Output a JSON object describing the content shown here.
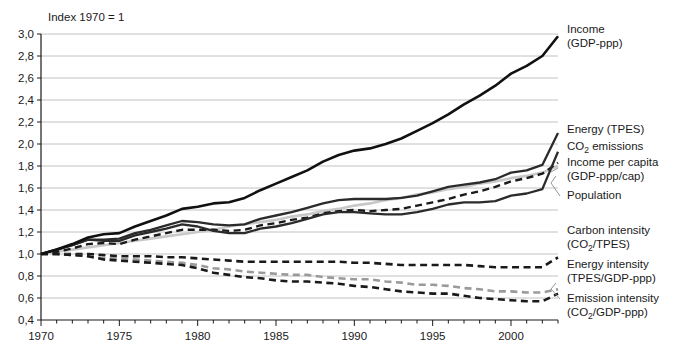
{
  "chart_data": {
    "type": "line",
    "title": "Index 1970 = 1",
    "xlabel": "",
    "ylabel": "",
    "xlim": [
      1970,
      2003
    ],
    "ylim": [
      0.4,
      3.0
    ],
    "ytick_step": 0.2,
    "grid": true,
    "legend_position": "right-inline-labels",
    "decimal_separator": ",",
    "xticks": [
      1970,
      1975,
      1980,
      1985,
      1990,
      1995,
      2000
    ],
    "xtick_labels": [
      "1970",
      "1975",
      "1980",
      "1985",
      "1990",
      "1995",
      "2000"
    ],
    "yticks": [
      0.4,
      0.6,
      0.8,
      1.0,
      1.2,
      1.4,
      1.6,
      1.8,
      2.0,
      2.2,
      2.4,
      2.6,
      2.8,
      3.0
    ],
    "ytick_labels": [
      "0,4",
      "0,6",
      "0,8",
      "1,0",
      "1,2",
      "1,4",
      "1,6",
      "1,8",
      "2,0",
      "2,2",
      "2,4",
      "2,6",
      "2,8",
      "3,0"
    ],
    "x": [
      1970,
      1971,
      1972,
      1973,
      1974,
      1975,
      1976,
      1977,
      1978,
      1979,
      1980,
      1981,
      1982,
      1983,
      1984,
      1985,
      1986,
      1987,
      1988,
      1989,
      1990,
      1991,
      1992,
      1993,
      1994,
      1995,
      1996,
      1997,
      1998,
      1999,
      2000,
      2001,
      2002,
      2003
    ],
    "series": [
      {
        "name": "Income (GDP-ppp)",
        "label_lines": [
          "Income",
          "(GDP-ppp)"
        ],
        "style": "solid",
        "color": "#111111",
        "width": 2.6,
        "values": [
          1.0,
          1.04,
          1.09,
          1.15,
          1.18,
          1.19,
          1.25,
          1.3,
          1.35,
          1.41,
          1.43,
          1.46,
          1.47,
          1.51,
          1.58,
          1.64,
          1.7,
          1.76,
          1.84,
          1.9,
          1.94,
          1.96,
          2.0,
          2.05,
          2.12,
          2.19,
          2.27,
          2.36,
          2.44,
          2.53,
          2.64,
          2.71,
          2.8,
          2.98
        ]
      },
      {
        "name": "Energy (TPES)",
        "label_lines": [
          "Energy (TPES)"
        ],
        "style": "solid",
        "color": "#2b2b2b",
        "width": 2.3,
        "values": [
          1.0,
          1.04,
          1.08,
          1.13,
          1.13,
          1.14,
          1.19,
          1.22,
          1.26,
          1.3,
          1.29,
          1.27,
          1.26,
          1.27,
          1.32,
          1.35,
          1.38,
          1.42,
          1.46,
          1.49,
          1.5,
          1.5,
          1.5,
          1.51,
          1.53,
          1.57,
          1.61,
          1.63,
          1.65,
          1.68,
          1.74,
          1.76,
          1.81,
          2.1
        ]
      },
      {
        "name": "CO2 emissions",
        "label_lines": [
          "CO",
          "2",
          " emissions"
        ],
        "style": "solid",
        "color": "#2b2b2b",
        "width": 2.3,
        "values": [
          1.0,
          1.04,
          1.08,
          1.13,
          1.12,
          1.12,
          1.17,
          1.2,
          1.23,
          1.27,
          1.25,
          1.21,
          1.19,
          1.19,
          1.23,
          1.25,
          1.28,
          1.32,
          1.36,
          1.38,
          1.38,
          1.37,
          1.36,
          1.36,
          1.38,
          1.41,
          1.45,
          1.47,
          1.47,
          1.48,
          1.53,
          1.55,
          1.59,
          1.93
        ]
      },
      {
        "name": "Income per capita (GDP-ppp/cap)",
        "label_lines": [
          "Income per capita",
          "(GDP-ppp/cap)"
        ],
        "style": "dashed",
        "color": "#1a1a1a",
        "width": 2.4,
        "values": [
          1.0,
          1.02,
          1.05,
          1.09,
          1.1,
          1.09,
          1.13,
          1.16,
          1.19,
          1.22,
          1.22,
          1.22,
          1.21,
          1.22,
          1.26,
          1.28,
          1.31,
          1.33,
          1.37,
          1.39,
          1.4,
          1.39,
          1.4,
          1.41,
          1.44,
          1.47,
          1.5,
          1.54,
          1.57,
          1.61,
          1.66,
          1.69,
          1.73,
          1.83
        ]
      },
      {
        "name": "Population",
        "label_lines": [
          "Population"
        ],
        "style": "solid",
        "color": "#c8c8c8",
        "width": 2.6,
        "values": [
          1.0,
          1.02,
          1.04,
          1.06,
          1.08,
          1.1,
          1.12,
          1.14,
          1.16,
          1.18,
          1.2,
          1.22,
          1.25,
          1.27,
          1.29,
          1.31,
          1.34,
          1.36,
          1.39,
          1.41,
          1.44,
          1.46,
          1.49,
          1.51,
          1.54,
          1.56,
          1.59,
          1.61,
          1.64,
          1.66,
          1.69,
          1.71,
          1.74,
          1.8
        ]
      },
      {
        "name": "Carbon intensity (CO2/TPES)",
        "label_lines": [
          "Carbon intensity",
          "(CO",
          "2",
          "/TPES)"
        ],
        "style": "dashed",
        "color": "#1a1a1a",
        "width": 2.6,
        "values": [
          1.0,
          1.0,
          1.0,
          1.0,
          0.99,
          0.98,
          0.98,
          0.98,
          0.97,
          0.97,
          0.96,
          0.95,
          0.94,
          0.93,
          0.93,
          0.93,
          0.93,
          0.93,
          0.93,
          0.93,
          0.92,
          0.92,
          0.91,
          0.9,
          0.9,
          0.9,
          0.9,
          0.9,
          0.89,
          0.88,
          0.88,
          0.88,
          0.88,
          0.97
        ]
      },
      {
        "name": "Energy intensity (TPES/GDP-ppp)",
        "label_lines": [
          "Energy intensity",
          "(TPES/GDP-ppp)"
        ],
        "style": "dashed",
        "color": "#9a9a9a",
        "width": 2.6,
        "values": [
          1.0,
          1.0,
          0.99,
          0.98,
          0.96,
          0.96,
          0.95,
          0.94,
          0.93,
          0.92,
          0.9,
          0.87,
          0.86,
          0.84,
          0.83,
          0.82,
          0.81,
          0.81,
          0.79,
          0.78,
          0.77,
          0.77,
          0.75,
          0.74,
          0.72,
          0.72,
          0.71,
          0.69,
          0.68,
          0.66,
          0.66,
          0.65,
          0.65,
          0.68
        ]
      },
      {
        "name": "Emission intensity (CO2/GDP-ppp)",
        "label_lines": [
          "Emission intensity",
          "(CO",
          "2",
          "/GDP-ppp)"
        ],
        "style": "dashed",
        "color": "#1a1a1a",
        "width": 2.6,
        "values": [
          1.0,
          1.0,
          0.99,
          0.98,
          0.95,
          0.94,
          0.93,
          0.92,
          0.91,
          0.9,
          0.87,
          0.83,
          0.81,
          0.79,
          0.78,
          0.76,
          0.75,
          0.75,
          0.74,
          0.73,
          0.71,
          0.7,
          0.68,
          0.66,
          0.65,
          0.64,
          0.64,
          0.62,
          0.6,
          0.59,
          0.58,
          0.57,
          0.57,
          0.64
        ]
      }
    ],
    "annotations": [
      {
        "name": "population-leader",
        "from_series": "Population"
      },
      {
        "name": "emission-intensity-leader",
        "from_series": "Emission intensity (CO2/GDP-ppp)"
      }
    ]
  }
}
